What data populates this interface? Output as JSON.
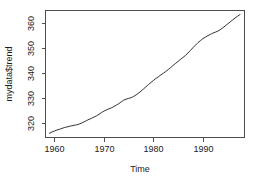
{
  "chart_data": {
    "type": "line",
    "title": "",
    "xlabel": "Time",
    "ylabel": "mydata$trend",
    "xlim": [
      1958.2,
      1998.4
    ],
    "ylim": [
      314.2,
      365.2
    ],
    "xticks": [
      1960,
      1970,
      1980,
      1990
    ],
    "xtick_labels": [
      "1960",
      "1970",
      "1980",
      "1990"
    ],
    "yticks": [
      320,
      330,
      340,
      350,
      360
    ],
    "ytick_labels": [
      "320",
      "330",
      "340",
      "350",
      "360"
    ],
    "grid": false,
    "legend": null,
    "box": "L-shaped-open",
    "series": [
      {
        "name": "mydata$trend",
        "color": "#1a1a1a",
        "x": [
          1959.0,
          1959.5,
          1960.0,
          1960.5,
          1961.0,
          1961.5,
          1962.0,
          1962.5,
          1963.0,
          1963.5,
          1964.0,
          1964.5,
          1965.0,
          1965.5,
          1966.0,
          1966.5,
          1967.0,
          1967.5,
          1968.0,
          1968.5,
          1969.0,
          1969.5,
          1970.0,
          1970.5,
          1971.0,
          1971.5,
          1972.0,
          1972.5,
          1973.0,
          1973.5,
          1974.0,
          1974.5,
          1975.0,
          1975.5,
          1976.0,
          1976.5,
          1977.0,
          1977.5,
          1978.0,
          1978.5,
          1979.0,
          1979.5,
          1980.0,
          1980.5,
          1981.0,
          1981.5,
          1982.0,
          1982.5,
          1983.0,
          1983.5,
          1984.0,
          1984.5,
          1985.0,
          1985.5,
          1986.0,
          1986.5,
          1987.0,
          1987.5,
          1988.0,
          1988.5,
          1989.0,
          1989.5,
          1990.0,
          1990.5,
          1991.0,
          1991.5,
          1992.0,
          1992.5,
          1993.0,
          1993.5,
          1994.0,
          1994.5,
          1995.0,
          1995.5,
          1996.0,
          1996.5,
          1997.0,
          1997.5
        ],
        "y": [
          315.9,
          316.4,
          316.8,
          317.2,
          317.5,
          317.8,
          318.2,
          318.4,
          318.7,
          318.9,
          319.1,
          319.3,
          319.6,
          320.0,
          320.5,
          321.0,
          321.5,
          321.9,
          322.4,
          322.9,
          323.5,
          324.2,
          324.8,
          325.3,
          325.7,
          326.1,
          326.6,
          327.2,
          327.8,
          328.5,
          329.2,
          329.6,
          329.9,
          330.2,
          330.7,
          331.3,
          332.0,
          332.8,
          333.7,
          334.6,
          335.5,
          336.3,
          337.1,
          337.9,
          338.6,
          339.3,
          340.0,
          340.7,
          341.5,
          342.3,
          343.2,
          344.0,
          344.8,
          345.6,
          346.4,
          347.2,
          348.2,
          349.2,
          350.3,
          351.3,
          352.3,
          353.1,
          353.9,
          354.5,
          355.1,
          355.6,
          356.1,
          356.5,
          356.9,
          357.5,
          358.2,
          359.0,
          359.8,
          360.6,
          361.4,
          362.2,
          362.9,
          363.6
        ]
      }
    ]
  }
}
